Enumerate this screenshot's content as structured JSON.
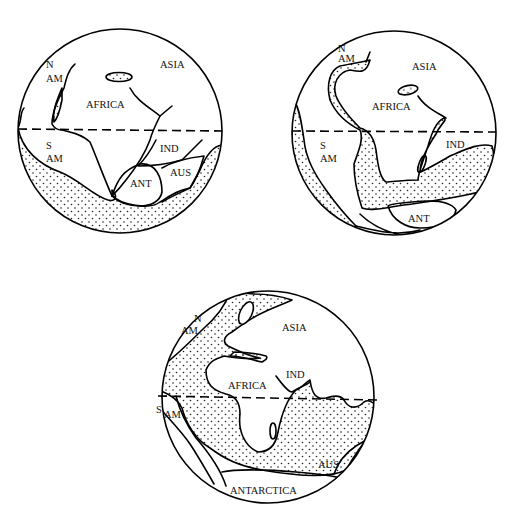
{
  "figure": {
    "globes": [
      {
        "id": "globe-1",
        "labels": [
          "N",
          "AM",
          "ASIA",
          "AFRICA",
          "S",
          "AM",
          "IND",
          "ANT",
          "AUS"
        ]
      },
      {
        "id": "globe-2",
        "labels": [
          "N",
          "AM",
          "ASIA",
          "AFRICA",
          "S",
          "AM",
          "IND",
          "ANT"
        ]
      },
      {
        "id": "globe-3",
        "labels": [
          "N",
          "AM",
          "ASIA",
          "AFRICA",
          "IND",
          "S",
          "AM",
          "AUS",
          "ANTARCTICA"
        ]
      }
    ],
    "legend": {
      "equator": "dashed line",
      "stipple": "ocean / shallow sea"
    }
  }
}
